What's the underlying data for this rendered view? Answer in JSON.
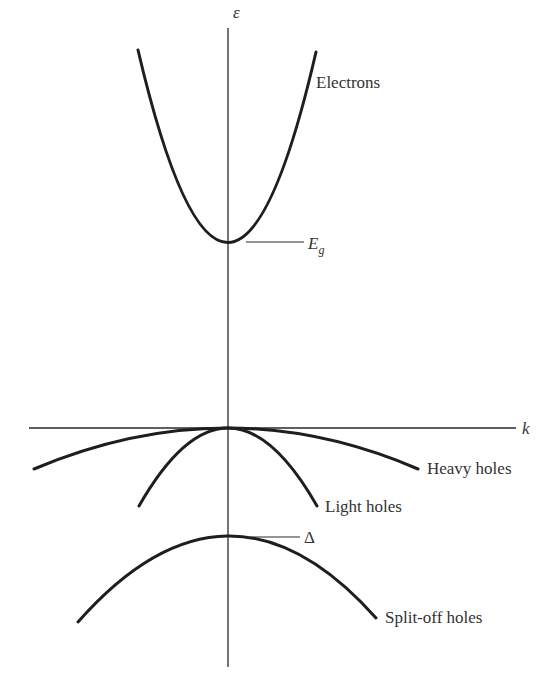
{
  "diagram": {
    "axes": {
      "vertical_label": "ε",
      "horizontal_label": "k"
    },
    "bands": [
      {
        "id": "electrons",
        "label": "Electrons",
        "curvature": "upward",
        "extremum": "E_g"
      },
      {
        "id": "heavy-holes",
        "label": "Heavy holes",
        "curvature": "downward-shallow",
        "extremum": "0"
      },
      {
        "id": "light-holes",
        "label": "Light holes",
        "curvature": "downward-steep",
        "extremum": "0"
      },
      {
        "id": "split-off-holes",
        "label": "Split-off holes",
        "curvature": "downward",
        "extremum": "-Δ"
      }
    ],
    "markers": {
      "gap_main": "E",
      "gap_sub": "g",
      "split_off": "Δ"
    }
  }
}
